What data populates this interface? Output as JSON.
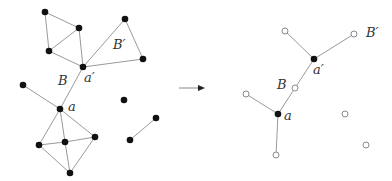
{
  "colors": {
    "edge": "#9a9a9a",
    "node": "#111111",
    "hollow_stroke": "#8a8a8a",
    "label": "#333333",
    "arrow": "#222222"
  },
  "left_graph": {
    "nodes": [
      {
        "id": "n1",
        "x": 45,
        "y": 12
      },
      {
        "id": "n2",
        "x": 79,
        "y": 28
      },
      {
        "id": "n3",
        "x": 49,
        "y": 51
      },
      {
        "id": "a_prime",
        "x": 83,
        "y": 67
      },
      {
        "id": "n5",
        "x": 125,
        "y": 19
      },
      {
        "id": "n6",
        "x": 143,
        "y": 59
      },
      {
        "id": "n7",
        "x": 23,
        "y": 85
      },
      {
        "id": "a",
        "x": 60,
        "y": 109
      },
      {
        "id": "n9",
        "x": 39,
        "y": 145
      },
      {
        "id": "n10",
        "x": 65,
        "y": 142
      },
      {
        "id": "n11",
        "x": 95,
        "y": 137
      },
      {
        "id": "n12",
        "x": 70,
        "y": 173
      },
      {
        "id": "n13",
        "x": 124,
        "y": 100
      },
      {
        "id": "n14",
        "x": 156,
        "y": 118
      },
      {
        "id": "n15",
        "x": 130,
        "y": 140
      }
    ],
    "edges": [
      [
        "n1",
        "n2"
      ],
      [
        "n1",
        "n3"
      ],
      [
        "n2",
        "n3"
      ],
      [
        "n2",
        "a_prime"
      ],
      [
        "n3",
        "a_prime"
      ],
      [
        "a_prime",
        "n5"
      ],
      [
        "n5",
        "n6"
      ],
      [
        "a_prime",
        "n6"
      ],
      [
        "a_prime",
        "a"
      ],
      [
        "n7",
        "a"
      ],
      [
        "a",
        "n9"
      ],
      [
        "a",
        "n10"
      ],
      [
        "a",
        "n11"
      ],
      [
        "n9",
        "n10"
      ],
      [
        "n10",
        "n11"
      ],
      [
        "n9",
        "n12"
      ],
      [
        "n10",
        "n12"
      ],
      [
        "n11",
        "n12"
      ],
      [
        "n14",
        "n15"
      ]
    ],
    "labels": [
      {
        "text": "B",
        "x": 58,
        "y": 78
      },
      {
        "text": "B′",
        "x": 113,
        "y": 42
      },
      {
        "text": "a′",
        "x": 84,
        "y": 72
      },
      {
        "text": "a",
        "x": 68,
        "y": 102
      }
    ]
  },
  "arrow": {
    "x1": 179,
    "y1": 88,
    "x2": 205,
    "y2": 88
  },
  "right_graph": {
    "nodes": [
      {
        "id": "r1",
        "x": 285,
        "y": 31,
        "filled": false
      },
      {
        "id": "r2",
        "x": 354,
        "y": 34,
        "filled": false
      },
      {
        "id": "a_prime",
        "x": 314,
        "y": 59,
        "filled": true
      },
      {
        "id": "B_node",
        "x": 295,
        "y": 88,
        "filled": false
      },
      {
        "id": "r4",
        "x": 246,
        "y": 94,
        "filled": false
      },
      {
        "id": "a",
        "x": 278,
        "y": 114,
        "filled": true
      },
      {
        "id": "r6",
        "x": 276,
        "y": 155,
        "filled": false
      },
      {
        "id": "r7",
        "x": 345,
        "y": 114,
        "filled": false
      },
      {
        "id": "r8",
        "x": 366,
        "y": 145,
        "filled": false
      }
    ],
    "edges": [
      [
        "r1",
        "a_prime"
      ],
      [
        "r2",
        "a_prime"
      ],
      [
        "a_prime",
        "B_node"
      ],
      [
        "B_node",
        "a"
      ],
      [
        "r4",
        "a"
      ],
      [
        "a",
        "r6"
      ]
    ],
    "labels": [
      {
        "text": "B′",
        "x": 366,
        "y": 26
      },
      {
        "text": "a′",
        "x": 313,
        "y": 65
      },
      {
        "text": "B",
        "x": 277,
        "y": 79
      },
      {
        "text": "a",
        "x": 284,
        "y": 111
      }
    ]
  }
}
